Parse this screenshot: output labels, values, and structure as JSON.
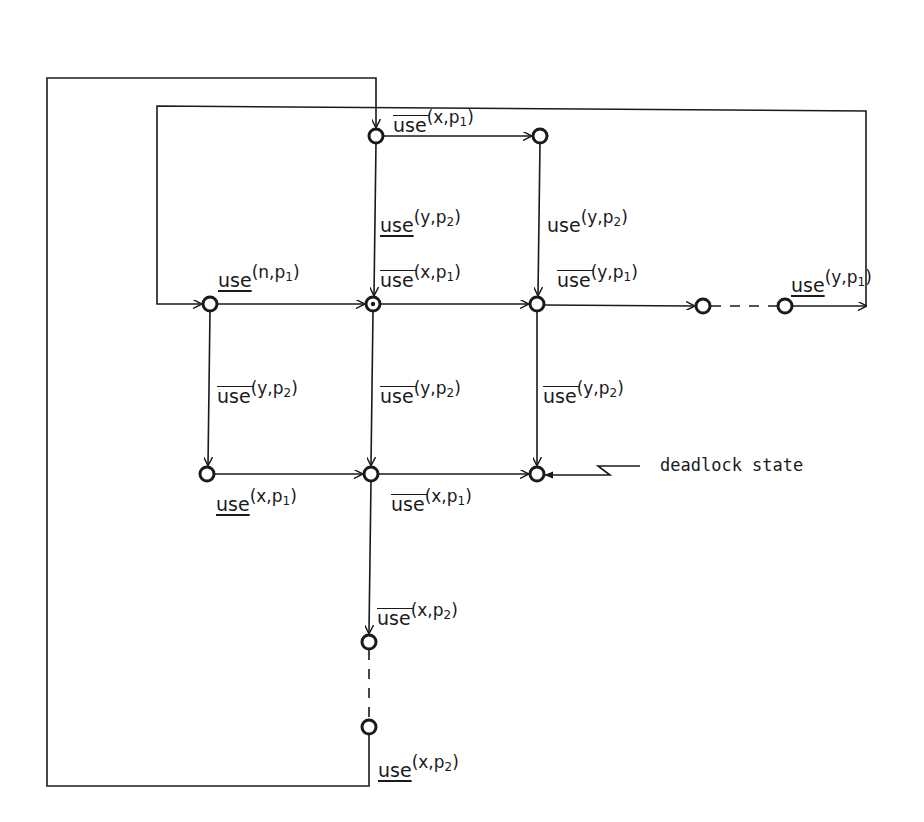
{
  "diagram": {
    "type": "state transition graph",
    "nodes": [
      {
        "id": "s_top_left",
        "x": 376,
        "y": 136
      },
      {
        "id": "s_top_right",
        "x": 540,
        "y": 136
      },
      {
        "id": "s_left",
        "x": 210,
        "y": 304
      },
      {
        "id": "s_initial",
        "x": 373,
        "y": 304,
        "initial": true
      },
      {
        "id": "s_mid",
        "x": 537,
        "y": 304
      },
      {
        "id": "s_right_a",
        "x": 703,
        "y": 306
      },
      {
        "id": "s_right_b",
        "x": 785,
        "y": 306
      },
      {
        "id": "s_bot_left",
        "x": 207,
        "y": 474
      },
      {
        "id": "s_bot_mid",
        "x": 371,
        "y": 474
      },
      {
        "id": "s_deadlock",
        "x": 537,
        "y": 474,
        "deadlock": true
      },
      {
        "id": "s_down_a",
        "x": 369,
        "y": 642
      },
      {
        "id": "s_down_b",
        "x": 369,
        "y": 727
      }
    ],
    "labels": [
      {
        "id": "l1",
        "op": "use",
        "bar": "over",
        "var": "x",
        "proc": "p",
        "sub": "1",
        "x": 393,
        "y": 108
      },
      {
        "id": "l2",
        "op": "use",
        "bar": "under",
        "var": "y",
        "proc": "p",
        "sub": "2",
        "x": 380,
        "y": 208
      },
      {
        "id": "l3",
        "op": "use",
        "bar": "none",
        "var": "y",
        "proc": "p",
        "sub": "2",
        "x": 547,
        "y": 208
      },
      {
        "id": "l4",
        "op": "use",
        "bar": "under",
        "var": "n",
        "proc": "p",
        "sub": "1",
        "x": 218,
        "y": 263
      },
      {
        "id": "l5",
        "op": "use",
        "bar": "over",
        "var": "x",
        "proc": "p",
        "sub": "1",
        "x": 380,
        "y": 263
      },
      {
        "id": "l6",
        "op": "use",
        "bar": "over",
        "var": "y",
        "proc": "p",
        "sub": "1",
        "x": 557,
        "y": 263
      },
      {
        "id": "l7",
        "op": "use",
        "bar": "under",
        "var": "y",
        "proc": "p",
        "sub": "1",
        "x": 791,
        "y": 268
      },
      {
        "id": "l8",
        "op": "use",
        "bar": "over",
        "var": "y",
        "proc": "p",
        "sub": "2",
        "x": 217,
        "y": 379
      },
      {
        "id": "l9",
        "op": "use",
        "bar": "over",
        "var": "y",
        "proc": "p",
        "sub": "2",
        "x": 380,
        "y": 379
      },
      {
        "id": "l10",
        "op": "use",
        "bar": "over",
        "var": "y",
        "proc": "p",
        "sub": "2",
        "x": 543,
        "y": 379
      },
      {
        "id": "l11",
        "op": "use",
        "bar": "under",
        "var": "x",
        "proc": "p",
        "sub": "1",
        "x": 216,
        "y": 487
      },
      {
        "id": "l12",
        "op": "use",
        "bar": "over",
        "var": "x",
        "proc": "p",
        "sub": "1",
        "x": 391,
        "y": 487
      },
      {
        "id": "l13",
        "op": "use",
        "bar": "over",
        "var": "x",
        "proc": "p",
        "sub": "2",
        "x": 377,
        "y": 601
      },
      {
        "id": "l14",
        "op": "use",
        "bar": "under",
        "var": "x",
        "proc": "p",
        "sub": "2",
        "x": 378,
        "y": 753
      }
    ],
    "annotation": {
      "text": "deadlock state",
      "x": 660,
      "y": 466
    }
  }
}
